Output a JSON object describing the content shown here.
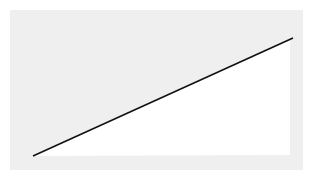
{
  "diagram": {
    "background_color": "#efefef",
    "fill_color": "#ffffff",
    "line_color": "#111111",
    "line": {
      "x1": 33,
      "y1": 156,
      "x2": 293,
      "y2": 38
    }
  }
}
